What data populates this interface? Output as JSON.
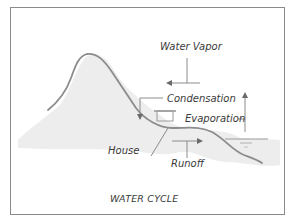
{
  "diagram": {
    "title": "WATER CYCLE",
    "labels": {
      "water_vapor": "Water Vapor",
      "condensation": "Condensation",
      "evaporation": "Evaporation",
      "house": "House",
      "runoff": "Runoff"
    },
    "icons": {
      "mountain": "mountain-icon",
      "house": "house-icon",
      "water": "water-body-icon",
      "arrows": [
        "arrow-left-icon",
        "arrow-down-icon",
        "arrow-up-icon",
        "arrow-right-icon"
      ]
    },
    "colors": {
      "frame": "#8a8a8a",
      "line": "#8c8c8c",
      "shading": "#ececec",
      "text": "#3a3a3a"
    }
  }
}
